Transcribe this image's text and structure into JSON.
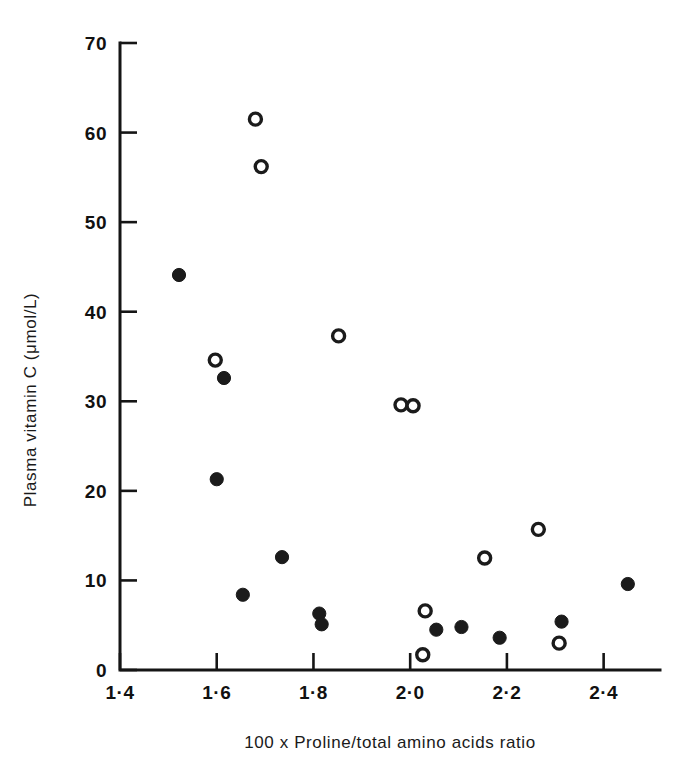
{
  "chart_data": {
    "type": "scatter",
    "title": "",
    "xlabel": "100 x Proline/total amino acids ratio",
    "ylabel": "Plasma vitamin C (μmol/L)",
    "xlim": [
      1.4,
      2.5
    ],
    "ylim": [
      0,
      70
    ],
    "xticks": [
      1.4,
      1.6,
      1.8,
      2.0,
      2.2,
      2.4
    ],
    "xtick_labels": [
      "1·4",
      "1·6",
      "1·8",
      "2·0",
      "2·2",
      "2·4"
    ],
    "yticks": [
      0,
      10,
      20,
      30,
      40,
      50,
      60,
      70
    ],
    "ytick_labels": [
      "0",
      "10",
      "20",
      "30",
      "40",
      "50",
      "60",
      "70"
    ],
    "grid": false,
    "legend": "none",
    "marker_size": 11,
    "series": [
      {
        "name": "filled",
        "marker": "filled-circle",
        "color": "#1b1b1b",
        "points": [
          {
            "x": 1.522,
            "y": 44.1
          },
          {
            "x": 1.6,
            "y": 21.3
          },
          {
            "x": 1.615,
            "y": 32.6
          },
          {
            "x": 1.654,
            "y": 8.4
          },
          {
            "x": 1.735,
            "y": 12.6
          },
          {
            "x": 1.812,
            "y": 6.3
          },
          {
            "x": 1.817,
            "y": 5.1
          },
          {
            "x": 2.054,
            "y": 4.5
          },
          {
            "x": 2.106,
            "y": 4.8
          },
          {
            "x": 2.185,
            "y": 3.6
          },
          {
            "x": 2.313,
            "y": 5.4
          },
          {
            "x": 2.45,
            "y": 9.6
          }
        ]
      },
      {
        "name": "open",
        "marker": "open-circle",
        "color": "#1b1b1b",
        "points": [
          {
            "x": 1.68,
            "y": 61.5
          },
          {
            "x": 1.692,
            "y": 56.2
          },
          {
            "x": 1.597,
            "y": 34.6
          },
          {
            "x": 1.852,
            "y": 37.3
          },
          {
            "x": 1.981,
            "y": 29.6
          },
          {
            "x": 2.006,
            "y": 29.5
          },
          {
            "x": 2.031,
            "y": 6.6
          },
          {
            "x": 2.026,
            "y": 1.7
          },
          {
            "x": 2.154,
            "y": 12.5
          },
          {
            "x": 2.265,
            "y": 15.7
          },
          {
            "x": 2.308,
            "y": 3.0
          }
        ]
      }
    ]
  }
}
